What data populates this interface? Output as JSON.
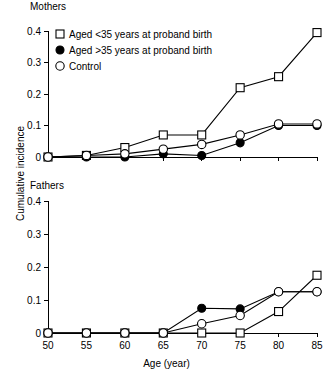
{
  "figure": {
    "ylabel": "Cumulative incidence",
    "xlabel": "Age (year)",
    "panels": [
      {
        "key": "mothers",
        "title": "Mothers"
      },
      {
        "key": "fathers",
        "title": "Fathers"
      }
    ],
    "legend": [
      {
        "marker": "open-square-icon",
        "label": "Aged <35 years at proband birth"
      },
      {
        "marker": "filled-circle-icon",
        "label": "Aged >35 years at proband birth"
      },
      {
        "marker": "open-circle-icon",
        "label": "Control"
      }
    ],
    "ytick_labels": [
      "0.4",
      "0.3",
      "0.2",
      "0.1",
      "0"
    ],
    "xtick_labels": [
      "50",
      "55",
      "60",
      "65",
      "70",
      "75",
      "80",
      "85"
    ]
  },
  "chart_data": [
    {
      "type": "line",
      "title": "Mothers",
      "xlabel": "Age (year)",
      "ylabel": "Cumulative incidence",
      "x": [
        50,
        55,
        60,
        65,
        70,
        75,
        80,
        85
      ],
      "xlim": [
        50,
        85
      ],
      "ylim": [
        0,
        0.4
      ],
      "yticks": [
        0,
        0.1,
        0.2,
        0.3,
        0.4
      ],
      "grid": false,
      "legend_position": "upper-left",
      "series": [
        {
          "name": "Aged <35 years at proband birth",
          "marker": "open-square",
          "values": [
            0.0,
            0.005,
            0.03,
            0.07,
            0.07,
            0.22,
            0.255,
            0.395
          ]
        },
        {
          "name": "Aged >35 years at proband birth",
          "marker": "filled-circle",
          "values": [
            0.0,
            0.0,
            0.0,
            0.01,
            0.005,
            0.045,
            0.1,
            0.1
          ]
        },
        {
          "name": "Control",
          "marker": "open-circle",
          "values": [
            0.0,
            0.005,
            0.01,
            0.025,
            0.04,
            0.07,
            0.105,
            0.105
          ]
        }
      ]
    },
    {
      "type": "line",
      "title": "Fathers",
      "xlabel": "Age (year)",
      "ylabel": "Cumulative incidence",
      "x": [
        50,
        55,
        60,
        65,
        70,
        75,
        80,
        85
      ],
      "xlim": [
        50,
        85
      ],
      "ylim": [
        0,
        0.4
      ],
      "yticks": [
        0,
        0.1,
        0.2,
        0.3,
        0.4
      ],
      "grid": false,
      "legend_position": "none",
      "series": [
        {
          "name": "Aged <35 years at proband birth",
          "marker": "open-square",
          "values": [
            0.0,
            0.0,
            0.0,
            0.0,
            0.0,
            0.0,
            0.065,
            0.175
          ]
        },
        {
          "name": "Aged >35 years at proband birth",
          "marker": "filled-circle",
          "values": [
            0.0,
            0.0,
            0.0,
            0.0,
            0.075,
            0.073,
            0.125,
            0.125
          ]
        },
        {
          "name": "Control",
          "marker": "open-circle",
          "values": [
            0.0,
            0.0,
            0.0,
            0.0,
            0.028,
            0.053,
            0.125,
            0.125
          ]
        }
      ]
    }
  ]
}
